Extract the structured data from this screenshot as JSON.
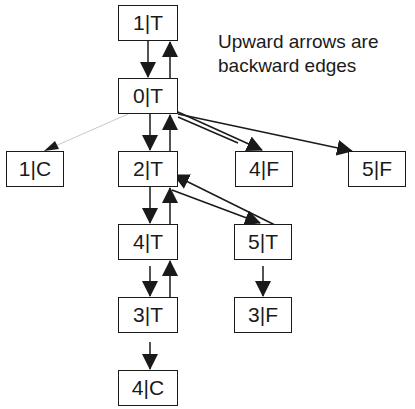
{
  "note": {
    "line1": "Upward arrows are",
    "line2": "backward edges"
  },
  "nodes": [
    {
      "id": "n1T",
      "label": "1|T",
      "x": 118,
      "y": 5,
      "w": 60,
      "h": 36
    },
    {
      "id": "n0T",
      "label": "0|T",
      "x": 118,
      "y": 78,
      "w": 60,
      "h": 36
    },
    {
      "id": "n1C",
      "label": "1|C",
      "x": 6,
      "y": 151,
      "w": 58,
      "h": 36
    },
    {
      "id": "n2T",
      "label": "2|T",
      "x": 118,
      "y": 151,
      "w": 60,
      "h": 36
    },
    {
      "id": "n4F",
      "label": "4|F",
      "x": 235,
      "y": 151,
      "w": 58,
      "h": 36
    },
    {
      "id": "n5F",
      "label": "5|F",
      "x": 348,
      "y": 151,
      "w": 58,
      "h": 36
    },
    {
      "id": "n4T",
      "label": "4|T",
      "x": 118,
      "y": 224,
      "w": 60,
      "h": 36
    },
    {
      "id": "n5T",
      "label": "5|T",
      "x": 234,
      "y": 224,
      "w": 58,
      "h": 36
    },
    {
      "id": "n3T",
      "label": "3|T",
      "x": 118,
      "y": 297,
      "w": 60,
      "h": 36
    },
    {
      "id": "n3F",
      "label": "3|F",
      "x": 234,
      "y": 297,
      "w": 58,
      "h": 36
    },
    {
      "id": "n4C",
      "label": "4|C",
      "x": 118,
      "y": 370,
      "w": 60,
      "h": 36
    }
  ],
  "edges": [
    {
      "from": "1|T",
      "to": "0|T",
      "type": "forward"
    },
    {
      "from": "0|T",
      "to": "1|T",
      "type": "backward"
    },
    {
      "from": "0|T",
      "to": "1|C",
      "type": "forward-faint"
    },
    {
      "from": "0|T",
      "to": "2|T",
      "type": "forward"
    },
    {
      "from": "2|T",
      "to": "0|T",
      "type": "backward"
    },
    {
      "from": "0|T",
      "to": "4|F",
      "type": "forward"
    },
    {
      "from": "0|T",
      "to": "5|F",
      "type": "forward"
    },
    {
      "from": "2|T",
      "to": "4|T",
      "type": "forward"
    },
    {
      "from": "4|T",
      "to": "2|T",
      "type": "backward"
    },
    {
      "from": "2|T",
      "to": "5|T",
      "type": "forward"
    },
    {
      "from": "5|T",
      "to": "2|T",
      "type": "backward"
    },
    {
      "from": "4|T",
      "to": "3|T",
      "type": "forward"
    },
    {
      "from": "3|T",
      "to": "4|T",
      "type": "backward"
    },
    {
      "from": "5|T",
      "to": "3|F",
      "type": "forward"
    },
    {
      "from": "3|T",
      "to": "4|C",
      "type": "forward"
    }
  ],
  "colors": {
    "stroke": "#1a1a1a",
    "faint_edge": "#c8c8c8",
    "background": "#ffffff"
  }
}
